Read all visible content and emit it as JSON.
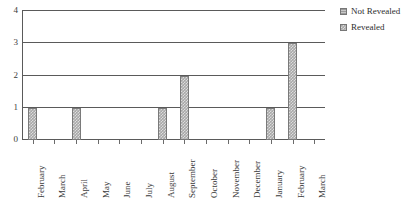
{
  "chart_data": {
    "type": "bar",
    "title": "",
    "xlabel": "",
    "ylabel": "",
    "ylim": [
      0,
      4
    ],
    "yticks": [
      "0",
      "1",
      "2",
      "3",
      "4"
    ],
    "grid": true,
    "legend_position": "top-right",
    "categories": [
      "February",
      "March",
      "April",
      "May",
      "June",
      "July",
      "August",
      "September",
      "October",
      "November",
      "December",
      "January",
      "February",
      "March"
    ],
    "series": [
      {
        "name": "Not Revealed",
        "color": "#9a9a9a",
        "values": [
          0,
          0,
          0,
          0,
          0,
          0,
          0,
          0,
          0,
          0,
          0,
          0,
          0,
          0
        ]
      },
      {
        "name": "Revealed",
        "color": "#a8a8a8",
        "values": [
          1,
          0,
          1,
          0,
          0,
          0,
          1,
          2,
          0,
          0,
          0,
          1,
          3,
          0
        ]
      }
    ]
  },
  "legend": {
    "entries": [
      {
        "label": "Not Revealed",
        "swatch": "not-revealed"
      },
      {
        "label": "Revealed",
        "swatch": "revealed"
      }
    ]
  }
}
